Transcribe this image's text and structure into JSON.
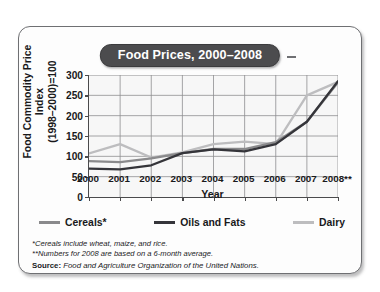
{
  "chart_data": {
    "type": "line",
    "title": "Food Prices, 2000–2008",
    "xlabel": "Year",
    "ylabel": "Food Commodity Price Index (1998–2000)=100",
    "ylabel_line1": "Food Commodity Price Index",
    "ylabel_line2": "(1998–2000)=100",
    "x": [
      "2000",
      "2001",
      "2002",
      "2003",
      "2004",
      "2005",
      "2006",
      "2007",
      "2008**"
    ],
    "categories": [
      "2000",
      "2001",
      "2002",
      "2003",
      "2004",
      "2005",
      "2006",
      "2007",
      "2008**"
    ],
    "xlim": [
      2000,
      2008
    ],
    "ylim": [
      0,
      300
    ],
    "yticks": [
      0,
      50,
      100,
      150,
      200,
      250,
      300
    ],
    "xticks": [
      "2000",
      "2001",
      "2002",
      "2003",
      "2004",
      "2005",
      "2006",
      "2007",
      "2008**"
    ],
    "grid": true,
    "grid_color": "#8e8e90",
    "legend_position": "below-plot",
    "plot_background": "#f7f7f7",
    "series": [
      {
        "name": "Cereals*",
        "color": "#8a8a8c",
        "values": [
          88,
          86,
          95,
          108,
          118,
          118,
          135,
          185,
          282
        ]
      },
      {
        "name": "Oils and Fats",
        "color": "#35353a",
        "values": [
          70,
          68,
          78,
          108,
          117,
          112,
          130,
          185,
          285
        ]
      },
      {
        "name": "Dairy",
        "color": "#bdbdbf",
        "values": [
          107,
          130,
          97,
          110,
          130,
          136,
          130,
          250,
          283
        ]
      }
    ],
    "annotations": [
      "*Cereals include wheat, maize, and rice.",
      "**Numbers for 2008 are based on a 6-month average."
    ]
  },
  "legend": {
    "items": [
      {
        "label": "Cereals*",
        "color": "#8a8a8c"
      },
      {
        "label": "Oils and Fats",
        "color": "#35353a"
      },
      {
        "label": "Dairy",
        "color": "#bdbdbf"
      }
    ]
  },
  "notes": {
    "footnote1": "*Cereals include wheat, maize, and rice.",
    "footnote2": "**Numbers for 2008 are based on a 6-month average.",
    "source_label": "Source",
    "source_separator": ": ",
    "source_text": "Food and Agriculture Organization of the United Nations."
  }
}
